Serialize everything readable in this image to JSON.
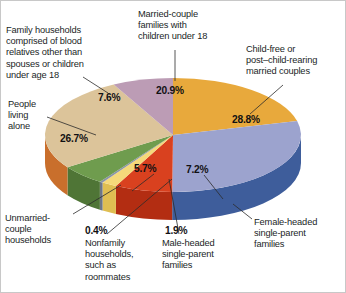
{
  "chart_data": {
    "type": "pie",
    "title": "",
    "subtitle": "",
    "xlabel": "",
    "ylabel": "",
    "legend_position": "callout-labels",
    "grid": false,
    "style": "3d-exploded-disc",
    "background_color": "#ffffff",
    "units": "percent",
    "total": 100.0,
    "start_angle_deg": 0,
    "direction": "clockwise",
    "categories": [
      "Married-couple families with children under 18",
      "Child-free or post–child-rearing married couples",
      "Female-headed single-parent families",
      "Male-headed single-parent families",
      "Nonfamily households, such as roommates",
      "Unmarried-couple households",
      "People living alone",
      "Family households comprised of blood relatives other than spouses or children under age 18"
    ],
    "values": [
      20.9,
      28.8,
      7.2,
      1.9,
      0.4,
      5.7,
      26.7,
      7.6
    ],
    "value_labels": [
      "20.9%",
      "28.8%",
      "7.2%",
      "1.9%",
      "0.4%",
      "5.7%",
      "26.7%",
      "7.6%"
    ],
    "colors": [
      "#e8a93c",
      "#9ca3ce",
      "#d9411f",
      "#f5d97a",
      "#8a94a8",
      "#6f9c4e",
      "#dcc49a",
      "#bc9cb5"
    ],
    "side_colors": [
      "#c98a24",
      "#3e5d9b",
      "#b32d12",
      "#dfbe52",
      "#6c7688",
      "#4f7536",
      "#c96f2c",
      "#9a7794"
    ],
    "slices": [
      {
        "label": "Married-couple families with children under 18",
        "value": 20.9,
        "display": "20.9%",
        "color": "#e8a93c"
      },
      {
        "label": "Child-free or post–child-rearing married couples",
        "value": 28.8,
        "display": "28.8%",
        "color": "#9ca3ce"
      },
      {
        "label": "Female-headed single-parent families",
        "value": 7.2,
        "display": "7.2%",
        "color": "#d9411f"
      },
      {
        "label": "Male-headed single-parent families",
        "value": 1.9,
        "display": "1.9%",
        "color": "#f5d97a"
      },
      {
        "label": "Nonfamily households, such as roommates",
        "value": 0.4,
        "display": "0.4%",
        "color": "#8a94a8"
      },
      {
        "label": "Unmarried-couple households",
        "value": 5.7,
        "display": "5.7%",
        "color": "#6f9c4e"
      },
      {
        "label": "People living alone",
        "value": 26.7,
        "display": "26.7%",
        "color": "#dcc49a"
      },
      {
        "label": "Family households comprised of blood relatives other than spouses or children under age 18",
        "value": 7.6,
        "display": "7.6%",
        "color": "#bc9cb5"
      }
    ]
  },
  "labels": {
    "blood_relatives": "Family households\ncomprised of blood\nrelatives other than\nspouses or children\nunder age 18",
    "married_couple_children": "Married-couple\nfamilies with\nchildren under 18",
    "child_free": "Child-free or\npost–child-rearing\nmarried couples",
    "people_living_alone": "People\nliving\nalone",
    "unmarried_couple": "Unmarried-\ncouple\nhouseholds",
    "nonfamily": "Nonfamily\nhouseholds,\nsuch as\nroommates",
    "male_headed": "Male-headed\nsingle-parent\nfamilies",
    "female_headed": "Female-headed\nsingle-parent\nfamilies"
  },
  "percents": {
    "married_couple_children": "20.9%",
    "child_free": "28.8%",
    "blood_relatives": "7.6%",
    "people_living_alone": "26.7%",
    "unmarried_couple": "5.7%",
    "female_headed": "7.2%",
    "nonfamily": "0.4%",
    "male_headed": "1.9%"
  }
}
